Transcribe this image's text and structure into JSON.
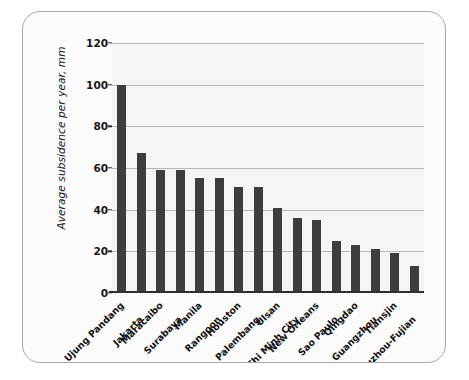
{
  "chart_data": {
    "type": "bar",
    "title": "",
    "subtitle": "",
    "xlabel": "",
    "ylabel": "Average subsidence per year, mm",
    "ylim": [
      0,
      120
    ],
    "ytick_labels": [
      "120",
      "100",
      "80",
      "60",
      "40",
      "20",
      "0"
    ],
    "ytick_values": [
      120,
      100,
      80,
      60,
      40,
      20,
      0
    ],
    "grid": true,
    "grid_axis": "y",
    "legend": false,
    "legend_position": "none",
    "bar_color": "#3d3d3d",
    "plot_background": "#f4f5f4",
    "grid_color": "#b4b7b4",
    "categories": [
      "Ujung Pandang",
      "Jakarta",
      "Maracaibo",
      "Surabaya",
      "Manila",
      "Rangoon",
      "Houston",
      "Palembang",
      "Ulsan",
      "Ho Chi Minh City",
      "New Orleans",
      "Sao Paulo",
      "Qingdao",
      "Guangzhou",
      "Tiansjin",
      "Fuzhou-Fujian"
    ],
    "values": [
      100,
      67,
      59,
      59,
      55,
      55,
      51,
      51,
      41,
      36,
      35,
      25,
      23,
      21,
      19,
      13
    ],
    "series": [
      {
        "name": "Average subsidence per year",
        "values": [
          100,
          67,
          59,
          59,
          55,
          55,
          51,
          51,
          41,
          36,
          35,
          25,
          23,
          21,
          19,
          13
        ]
      }
    ]
  },
  "figure": {
    "border_color": "#a8a8a8",
    "background": "#fbfbfb"
  }
}
